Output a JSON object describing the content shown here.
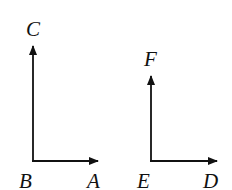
{
  "diagram": {
    "left_figure": {
      "vertex_label": "B",
      "vertical_label": "C",
      "horizontal_label": "A"
    },
    "right_figure": {
      "vertex_label": "E",
      "vertical_label": "F",
      "horizontal_label": "D"
    },
    "line_color": "#111111"
  }
}
